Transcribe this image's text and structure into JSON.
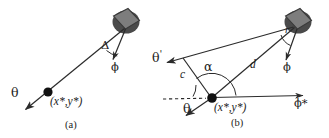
{
  "figure": {
    "caption_a": "(a)",
    "caption_b": "(b)",
    "background_color": "#ffffff",
    "line_color": "#2b2b2b",
    "robot_fill": "#7d7d7d",
    "robot_stroke": "#3a3a3a",
    "robot_shadow": "#4a4a4a",
    "point_color": "#111111"
  },
  "panel_a": {
    "name": "panel-a",
    "labels": {
      "theta": "θ",
      "phi": "ϕ",
      "delta": "Δ",
      "position": "(x*,y*)"
    }
  },
  "panel_b": {
    "name": "panel-b",
    "labels": {
      "theta": "θ",
      "theta_prime": "θ",
      "theta_prime_mark": "'",
      "phi": "ϕ",
      "phi_star": "ϕ*",
      "alpha": "α",
      "c": "c",
      "d": "d",
      "r": "r",
      "position": "(x*,y*)"
    }
  }
}
